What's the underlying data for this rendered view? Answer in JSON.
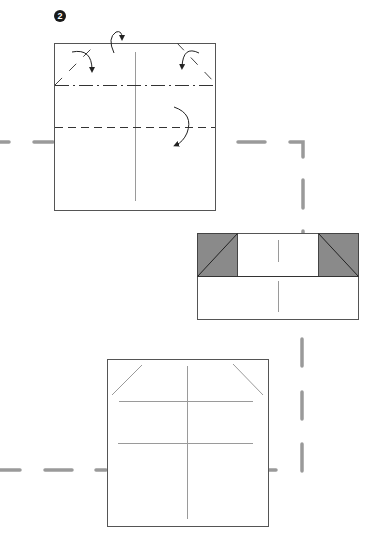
{
  "diagram": {
    "type": "origami-instruction",
    "step": {
      "number": "2",
      "badge_color": "#1a1a1a",
      "text_color": "#ffffff"
    },
    "colors": {
      "paper_fill": "#ffffff",
      "paper_edge": "#555555",
      "crease": "#9a9a9a",
      "fold_line": "#333333",
      "flap_fill": "#8a8a8a",
      "path_dash": "#9a9a9a",
      "arrow": "#222222"
    },
    "figures": [
      {
        "id": "fig-a",
        "description": "Square sheet with valley fold corners, mountain fold along top strip and valley fold across middle",
        "bounds": {
          "x": 54,
          "y": 43,
          "w": 162,
          "h": 168
        },
        "lines": [
          {
            "kind": "crease",
            "label": "center vertical crease"
          },
          {
            "kind": "mountain-fold",
            "label": "dash-dot line near top",
            "y": 85
          },
          {
            "kind": "valley-fold",
            "label": "dashed line across middle",
            "y": 128
          },
          {
            "kind": "corner-fold",
            "label": "top-left corner diagonal"
          },
          {
            "kind": "corner-fold",
            "label": "top-right corner diagonal"
          }
        ],
        "arrows": [
          {
            "label": "fold top-left corner",
            "direction": "clockwise"
          },
          {
            "label": "mountain fold top edge behind",
            "direction": "over-behind"
          },
          {
            "label": "fold top-right corner",
            "direction": "counterclockwise"
          },
          {
            "label": "valley fold down",
            "direction": "down"
          }
        ]
      },
      {
        "id": "fig-b",
        "description": "Result: top strip folded with shaded triangular corner flaps",
        "bounds": {
          "x": 197,
          "y": 233,
          "w": 162,
          "h": 87
        },
        "flaps": [
          {
            "side": "left",
            "shaded": true
          },
          {
            "side": "right",
            "shaded": true
          }
        ]
      },
      {
        "id": "fig-c",
        "description": "Square sheet showing creases after unfolding",
        "bounds": {
          "x": 107,
          "y": 359,
          "w": 161,
          "h": 168
        },
        "lines": [
          {
            "kind": "crease",
            "label": "center vertical crease"
          },
          {
            "kind": "crease",
            "label": "upper horizontal crease"
          },
          {
            "kind": "crease",
            "label": "lower horizontal crease"
          },
          {
            "kind": "crease",
            "label": "top-left diagonal crease"
          },
          {
            "kind": "crease",
            "label": "top-right diagonal crease"
          }
        ]
      }
    ],
    "flow_path": {
      "style": "gray dashed connector",
      "description": "Dashed path connecting figures: horizontal across first figure, down the right side, and back left across the bottom figure"
    }
  }
}
